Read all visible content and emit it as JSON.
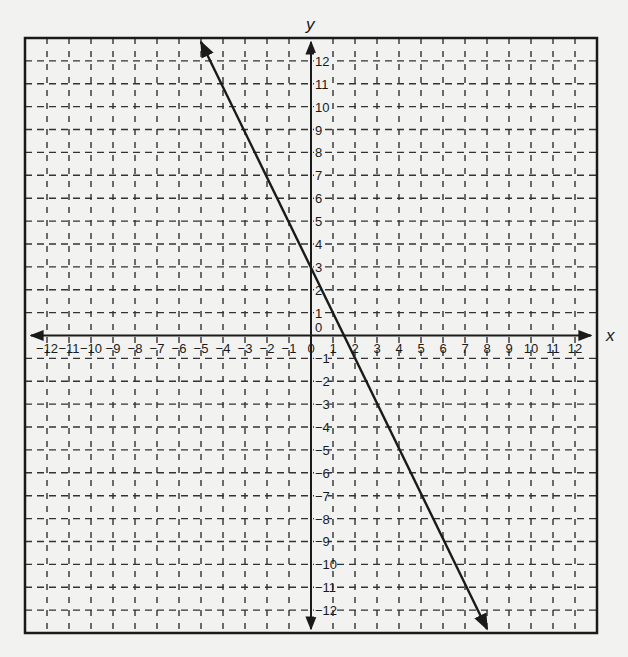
{
  "chart_data": {
    "type": "line",
    "title": "",
    "xlabel": "x",
    "ylabel": "y",
    "xlim": [
      -13,
      13
    ],
    "ylim": [
      -13,
      13
    ],
    "grid": true,
    "grid_style": "dashed",
    "x_ticks": [
      -12,
      -11,
      -10,
      -9,
      -8,
      -7,
      -6,
      -5,
      -4,
      -3,
      -2,
      -1,
      0,
      1,
      2,
      3,
      4,
      5,
      6,
      7,
      8,
      9,
      10,
      11,
      12
    ],
    "y_ticks": [
      -12,
      -11,
      -10,
      -9,
      -8,
      -7,
      -6,
      -5,
      -4,
      -3,
      -2,
      -1,
      1,
      2,
      3,
      4,
      5,
      6,
      7,
      8,
      9,
      10,
      11,
      12
    ],
    "series": [
      {
        "name": "line",
        "equation": "y = -2x + 3",
        "slope": -2,
        "intercept": 3,
        "points": [
          [
            -5,
            13
          ],
          [
            0,
            3
          ],
          [
            1.5,
            0
          ],
          [
            8,
            -13
          ]
        ],
        "arrows": "both"
      }
    ],
    "colors": {
      "line": "#1a1a1a",
      "grid": "#333333",
      "background": "#f2f2f0"
    }
  }
}
